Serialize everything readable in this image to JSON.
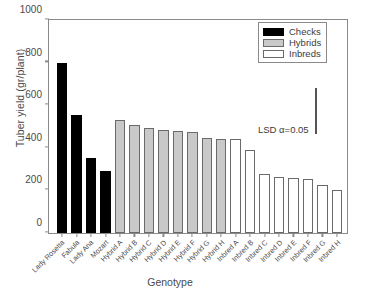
{
  "chart_data": {
    "type": "bar",
    "title": "",
    "xlabel": "Genotype",
    "ylabel": "Tuber yield (gr/plant)",
    "ylim": [
      0,
      1000
    ],
    "yticks": [
      0,
      200,
      400,
      600,
      800,
      1000
    ],
    "grid": false,
    "legend_position": "top-right",
    "categories": [
      "Lady Rosetta",
      "Fabula",
      "Lady Ana",
      "Mozart",
      "Hybrid A",
      "Hybrid B",
      "Hybrid C",
      "Hybrid D",
      "Hybrid E",
      "Hybrid F",
      "Hybrid G",
      "Hybrid H",
      "Inbred A",
      "Inbred B",
      "Inbred C",
      "Inbred D",
      "Inbred E",
      "Inbred F",
      "Inbred G",
      "Inbred H"
    ],
    "values": [
      798,
      553,
      352,
      291,
      532,
      508,
      491,
      483,
      480,
      472,
      448,
      443,
      443,
      388,
      279,
      262,
      258,
      255,
      226,
      201
    ],
    "groups": [
      "Checks",
      "Checks",
      "Checks",
      "Checks",
      "Hybrids",
      "Hybrids",
      "Hybrids",
      "Hybrids",
      "Hybrids",
      "Hybrids",
      "Hybrids",
      "Hybrids",
      "Inbreds",
      "Inbreds",
      "Inbreds",
      "Inbreds",
      "Inbreds",
      "Inbreds",
      "Inbreds",
      "Inbreds"
    ],
    "legend": [
      {
        "label": "Checks",
        "color": "#000000"
      },
      {
        "label": "Hybrids",
        "color": "#c9c9c9"
      },
      {
        "label": "Inbreds",
        "color": "#ffffff"
      }
    ],
    "annotations": [
      {
        "name": "lsd",
        "text": "LSD α=0.05",
        "value": 215
      }
    ]
  }
}
